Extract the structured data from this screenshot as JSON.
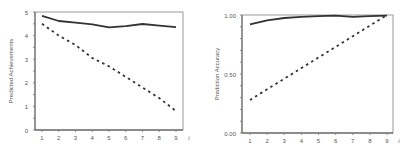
{
  "chart_data": [
    {
      "type": "line",
      "title": "",
      "xlabel": "i",
      "ylabel": "Predicted Achievements",
      "x": [
        1,
        2,
        3,
        4,
        5,
        6,
        7,
        8,
        9
      ],
      "xticks": [
        "1",
        "2",
        "3",
        "4",
        "5",
        "6",
        "7",
        "8",
        "9"
      ],
      "yticks": [
        "0",
        "1",
        "2",
        "3",
        "4",
        "5"
      ],
      "ylim": [
        0,
        5
      ],
      "grid": false,
      "legend": null,
      "series": [
        {
          "name": "solid",
          "style": "solid",
          "values": [
            4.84,
            4.62,
            4.55,
            4.48,
            4.35,
            4.4,
            4.49,
            4.42,
            4.36
          ]
        },
        {
          "name": "dashed",
          "style": "dashed",
          "values": [
            4.5,
            4.0,
            3.6,
            3.05,
            2.7,
            2.25,
            1.8,
            1.35,
            0.8
          ]
        }
      ]
    },
    {
      "type": "line",
      "title": "",
      "xlabel": "i",
      "ylabel": "Prediction Accuracy",
      "x": [
        1,
        2,
        3,
        4,
        5,
        6,
        7,
        8,
        9
      ],
      "xticks": [
        "1",
        "2",
        "3",
        "4",
        "5",
        "6",
        "7",
        "8",
        "9"
      ],
      "yticks": [
        "0.00",
        "0.50",
        "1.00"
      ],
      "ylim": [
        0,
        1
      ],
      "grid": false,
      "legend": null,
      "series": [
        {
          "name": "solid",
          "style": "solid",
          "values": [
            0.92,
            0.955,
            0.975,
            0.985,
            0.99,
            0.995,
            0.985,
            0.99,
            0.995
          ]
        },
        {
          "name": "dashed",
          "style": "dashed",
          "values": [
            0.28,
            0.37,
            0.46,
            0.55,
            0.64,
            0.73,
            0.82,
            0.91,
            1.0
          ]
        }
      ]
    }
  ],
  "colors": {
    "axis": "#777777",
    "line": "#333333",
    "text": "#555555",
    "background": "#ffffff"
  }
}
